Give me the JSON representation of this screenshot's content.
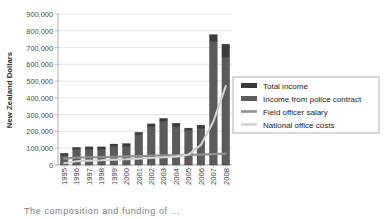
{
  "chart_data": {
    "type": "bar",
    "title": "",
    "subtitle": "",
    "xlabel": "",
    "ylabel": "New Zealand Dollars",
    "categories": [
      "1995",
      "1996",
      "1997",
      "1998",
      "1999",
      "2000",
      "2001",
      "2002",
      "2003",
      "2004",
      "2005",
      "2006",
      "2007",
      "2008"
    ],
    "ylim": [
      0,
      900000
    ],
    "ytick_values": [
      0,
      100000,
      200000,
      300000,
      400000,
      500000,
      600000,
      700000,
      800000,
      900000
    ],
    "ytick_labels": [
      "0",
      "100,000",
      "200,000",
      "300,000",
      "400,000",
      "500,000",
      "600,000",
      "700,000",
      "800,000",
      "900,000"
    ],
    "grid": true,
    "grid_axis": "y",
    "legend_position": "center right",
    "series": [
      {
        "name": "Income from police contract",
        "kind": "bar",
        "stack": "income",
        "color": "#5b5b5b",
        "values": [
          55000,
          93000,
          95000,
          95000,
          110000,
          112000,
          180000,
          228000,
          262000,
          232000,
          205000,
          220000,
          735000,
          640000
        ]
      },
      {
        "name": "Total income",
        "kind": "bar",
        "stack": "income",
        "color": "#3a3a3a",
        "values": [
          15000,
          12000,
          13000,
          13000,
          15000,
          16000,
          15000,
          17000,
          16000,
          17000,
          15000,
          18000,
          42000,
          80000
        ]
      },
      {
        "name": "Field officer salary",
        "kind": "line",
        "color": "#8f8f8f",
        "values": [
          38000,
          44000,
          46000,
          47000,
          49000,
          51000,
          53000,
          55000,
          57000,
          58000,
          60000,
          62000,
          65000,
          68000
        ]
      },
      {
        "name": "National office costs",
        "kind": "line",
        "color": "#d2d2d2",
        "values": [
          10000,
          22000,
          26000,
          28000,
          32000,
          34000,
          38000,
          42000,
          46000,
          50000,
          62000,
          120000,
          260000,
          470000
        ]
      }
    ]
  },
  "legend": {
    "entries": [
      {
        "label": "Total income",
        "color": "#3a3a3a",
        "marker": "swatch"
      },
      {
        "label": "Income from police contract",
        "color": "#5b5b5b",
        "marker": "swatch"
      },
      {
        "label": "Field officer salary",
        "color": "#8f8f8f",
        "marker": "line"
      },
      {
        "label": "National office costs",
        "color": "#d2d2d2",
        "marker": "line"
      }
    ]
  },
  "caption": {
    "text": "The composition and funding of ..."
  }
}
